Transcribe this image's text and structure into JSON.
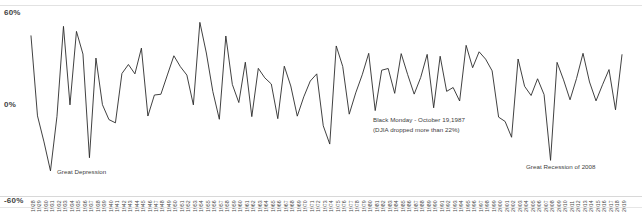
{
  "chart_data": {
    "type": "line",
    "title": "",
    "subtitle": "",
    "xlabel": "",
    "ylabel": "",
    "ylim": [
      -60,
      60
    ],
    "grid": false,
    "legend": "none",
    "series_name": "Annual Return (%)",
    "line_color": "#2b2b2b",
    "categories": [
      "1928",
      "1929",
      "1930",
      "1931",
      "1932",
      "1933",
      "1934",
      "1935",
      "1936",
      "1937",
      "1938",
      "1939",
      "1940",
      "1941",
      "1942",
      "1943",
      "1944",
      "1945",
      "1946",
      "1947",
      "1948",
      "1949",
      "1950",
      "1951",
      "1952",
      "1953",
      "1954",
      "1955",
      "1956",
      "1957",
      "1958",
      "1959",
      "1960",
      "1961",
      "1962",
      "1963",
      "1964",
      "1965",
      "1966",
      "1967",
      "1968",
      "1969",
      "1970",
      "1971",
      "1972",
      "1973",
      "1974",
      "1975",
      "1976",
      "1977",
      "1978",
      "1979",
      "1980",
      "1981",
      "1982",
      "1983",
      "1984",
      "1985",
      "1986",
      "1987",
      "1988",
      "1989",
      "1990",
      "1991",
      "1992",
      "1993",
      "1994",
      "1995",
      "1996",
      "1997",
      "1998",
      "1999",
      "2000",
      "2001",
      "2002",
      "2003",
      "2004",
      "2005",
      "2006",
      "2007",
      "2008",
      "2009",
      "2010",
      "2011",
      "2012",
      "2013",
      "2014",
      "2015",
      "2016",
      "2017",
      "2018",
      "2019"
    ],
    "values": [
      43.8,
      -8.3,
      -25.1,
      -43.8,
      -8.6,
      50.0,
      -1.2,
      46.7,
      31.9,
      -35.3,
      29.3,
      -1.1,
      -10.7,
      -12.8,
      19.2,
      25.1,
      19.0,
      35.8,
      -8.4,
      5.2,
      5.7,
      18.3,
      30.8,
      23.7,
      18.2,
      -1.2,
      52.6,
      32.6,
      7.4,
      -10.5,
      43.7,
      12.1,
      0.3,
      26.6,
      -8.8,
      22.6,
      16.4,
      12.4,
      -10.1,
      24.0,
      11.1,
      -8.5,
      4.0,
      14.3,
      19.0,
      -14.7,
      -26.5,
      37.2,
      23.8,
      -7.2,
      6.6,
      18.4,
      32.4,
      -4.9,
      21.4,
      22.5,
      6.3,
      32.2,
      18.5,
      5.8,
      16.6,
      31.7,
      -3.1,
      30.5,
      7.6,
      10.1,
      1.3,
      37.6,
      23.0,
      33.4,
      28.6,
      21.0,
      -9.1,
      -11.9,
      -22.1,
      28.7,
      10.9,
      4.9,
      15.8,
      5.5,
      -37.0,
      26.5,
      15.1,
      2.1,
      16.0,
      32.4,
      13.7,
      1.4,
      11.9,
      21.8,
      -4.4,
      31.5
    ],
    "ytick_labels": [
      "60%",
      "0%",
      "-60%"
    ],
    "ytick_values": [
      60,
      0,
      -60
    ],
    "annotations": [
      {
        "name": "great-depression",
        "text": "Great Depression",
        "year": "1931"
      },
      {
        "name": "black-monday-line1",
        "text": "Black Monday - October 19,1987",
        "year": "1987"
      },
      {
        "name": "black-monday-line2",
        "text": "(DJIA dropped more than 22%)",
        "year": "1987"
      },
      {
        "name": "great-recession",
        "text": "Great Recession of 2008",
        "year": "2008"
      }
    ]
  },
  "axis": {
    "y_top": "60%",
    "y_zero": "0%",
    "y_bottom": "-60%"
  },
  "annotations": {
    "great_depression": "Great Depression",
    "black_monday_line1": "Black Monday - October 19,1987",
    "black_monday_line2": "(DJIA dropped more than 22%)",
    "great_recession": "Great Recession of 2008"
  }
}
